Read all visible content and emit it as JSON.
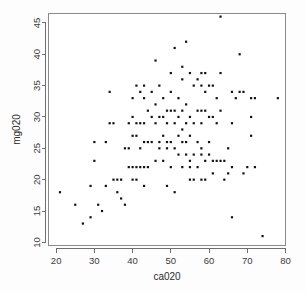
{
  "chart_data": {
    "type": "scatter",
    "title": "",
    "subtitle": "",
    "xlabel": "ca020",
    "ylabel": "mg020",
    "xlim": [
      18,
      80
    ],
    "ylim": [
      9.5,
      46.5
    ],
    "xticks": [
      20,
      30,
      40,
      50,
      60,
      70,
      80
    ],
    "yticks": [
      10,
      15,
      20,
      25,
      30,
      35,
      40,
      45
    ],
    "grid": false,
    "legend": null,
    "point_color": "#121212",
    "point_marker": "square",
    "panel_border_color": "#8a8a8a",
    "background_color": "#ffffff",
    "annotations": [],
    "points": [
      [
        21,
        18
      ],
      [
        25,
        16
      ],
      [
        27,
        13
      ],
      [
        29,
        14
      ],
      [
        29,
        19
      ],
      [
        30,
        23
      ],
      [
        30,
        26
      ],
      [
        31,
        16
      ],
      [
        32,
        15
      ],
      [
        33,
        19
      ],
      [
        33,
        26
      ],
      [
        34,
        34
      ],
      [
        34,
        29
      ],
      [
        35,
        29
      ],
      [
        35,
        20
      ],
      [
        36,
        20
      ],
      [
        36,
        18
      ],
      [
        37,
        20
      ],
      [
        37,
        17
      ],
      [
        38,
        25
      ],
      [
        38,
        16
      ],
      [
        39,
        25
      ],
      [
        39,
        22
      ],
      [
        39,
        29
      ],
      [
        40,
        22
      ],
      [
        40,
        20
      ],
      [
        40,
        33
      ],
      [
        40,
        27
      ],
      [
        40,
        30
      ],
      [
        41,
        22
      ],
      [
        41,
        29
      ],
      [
        41,
        27
      ],
      [
        41,
        35
      ],
      [
        41,
        20
      ],
      [
        42,
        22
      ],
      [
        42,
        29
      ],
      [
        42,
        34
      ],
      [
        42,
        25
      ],
      [
        43,
        29
      ],
      [
        43,
        26
      ],
      [
        43,
        35
      ],
      [
        43,
        33
      ],
      [
        43,
        22
      ],
      [
        43,
        19
      ],
      [
        44,
        26
      ],
      [
        44,
        31
      ],
      [
        44,
        22
      ],
      [
        45,
        30
      ],
      [
        45,
        26
      ],
      [
        45,
        34
      ],
      [
        46,
        39
      ],
      [
        46,
        29
      ],
      [
        46,
        23
      ],
      [
        46,
        32
      ],
      [
        47,
        30
      ],
      [
        47,
        35
      ],
      [
        47,
        26
      ],
      [
        47,
        25
      ],
      [
        48,
        30
      ],
      [
        48,
        27
      ],
      [
        48,
        33
      ],
      [
        48,
        23
      ],
      [
        49,
        29
      ],
      [
        49,
        26
      ],
      [
        49,
        31
      ],
      [
        49,
        25
      ],
      [
        49,
        19
      ],
      [
        50,
        37
      ],
      [
        50,
        34
      ],
      [
        50,
        31
      ],
      [
        50,
        26
      ],
      [
        50,
        22
      ],
      [
        51,
        31
      ],
      [
        51,
        25
      ],
      [
        51,
        29
      ],
      [
        51,
        41
      ],
      [
        51,
        18
      ],
      [
        52,
        30
      ],
      [
        52,
        27
      ],
      [
        52,
        24
      ],
      [
        52,
        33
      ],
      [
        53,
        38
      ],
      [
        53,
        36
      ],
      [
        53,
        28
      ],
      [
        53,
        26
      ],
      [
        53,
        31
      ],
      [
        53,
        22
      ],
      [
        54,
        42
      ],
      [
        54,
        29
      ],
      [
        54,
        32
      ],
      [
        54,
        26
      ],
      [
        54,
        24
      ],
      [
        55,
        37
      ],
      [
        55,
        30
      ],
      [
        55,
        27
      ],
      [
        55,
        22
      ],
      [
        55,
        23
      ],
      [
        55,
        20
      ],
      [
        56,
        35
      ],
      [
        56,
        29
      ],
      [
        56,
        24
      ],
      [
        56,
        20
      ],
      [
        57,
        36
      ],
      [
        57,
        31
      ],
      [
        57,
        26
      ],
      [
        57,
        22
      ],
      [
        58,
        37
      ],
      [
        58,
        35
      ],
      [
        58,
        31
      ],
      [
        58,
        29
      ],
      [
        58,
        25
      ],
      [
        58,
        24
      ],
      [
        58,
        20
      ],
      [
        59,
        37
      ],
      [
        59,
        34
      ],
      [
        59,
        31
      ],
      [
        59,
        23
      ],
      [
        59,
        20
      ],
      [
        60,
        35
      ],
      [
        60,
        30
      ],
      [
        60,
        26
      ],
      [
        60,
        24
      ],
      [
        61,
        35
      ],
      [
        61,
        30
      ],
      [
        61,
        23
      ],
      [
        61,
        21
      ],
      [
        62,
        33
      ],
      [
        62,
        29
      ],
      [
        62,
        23
      ],
      [
        63,
        46
      ],
      [
        63,
        37
      ],
      [
        63,
        31
      ],
      [
        63,
        23
      ],
      [
        64,
        23
      ],
      [
        64,
        20
      ],
      [
        65,
        25
      ],
      [
        65,
        21
      ],
      [
        66,
        34
      ],
      [
        66,
        29
      ],
      [
        66,
        22
      ],
      [
        66,
        14
      ],
      [
        67,
        33
      ],
      [
        68,
        40
      ],
      [
        68,
        34
      ],
      [
        69,
        34
      ],
      [
        69,
        21
      ],
      [
        70,
        22
      ],
      [
        71,
        33
      ],
      [
        71,
        30
      ],
      [
        71,
        27
      ],
      [
        72,
        33
      ],
      [
        72,
        22
      ],
      [
        74,
        11
      ],
      [
        78,
        33
      ]
    ]
  }
}
